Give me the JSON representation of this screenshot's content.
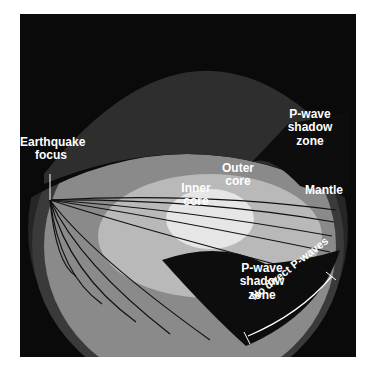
{
  "diagram": {
    "title": "P-wave shadow zone",
    "labels": {
      "focus": [
        "Earthquake",
        "focus"
      ],
      "outer_core": [
        "Outer",
        "core"
      ],
      "inner_core": [
        "Inner",
        "core"
      ],
      "mantle": "Mantle",
      "shadow_top": [
        "P-wave",
        "shadow",
        "zone"
      ],
      "shadow_bottom": [
        "P-wave",
        "shadow",
        "zone"
      ],
      "no_direct": "No direct P-waves"
    },
    "colors": {
      "background": "#0a0a0a",
      "crust": "#3a3a3a",
      "mantle": "#8a8a8a",
      "outer_core": "#b9b9b9",
      "inner_core": "#e6e6e6",
      "shadow": "#0d0d0d",
      "ray": "#111111",
      "text": "#ffffff"
    }
  }
}
